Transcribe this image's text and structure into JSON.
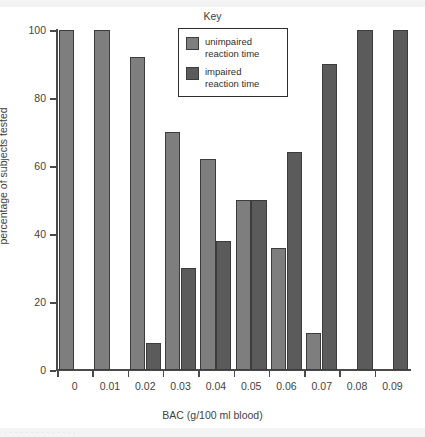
{
  "key_title": "Key",
  "legend": {
    "position": "top-center-inside",
    "entries": [
      {
        "label": "unimpaired\nreaction time",
        "color": "#7e7e7e",
        "series": "unimpaired"
      },
      {
        "label": "impaired\nreaction time",
        "color": "#5b5b5b",
        "series": "impaired"
      }
    ]
  },
  "axes": {
    "y_title": "percentage of subjects tested",
    "x_title": "BAC (g/100 ml blood)",
    "y_ticks": [
      "0",
      "20",
      "40",
      "60",
      "80",
      "100"
    ],
    "x_ticks": [
      "0",
      "0.01",
      "0.02",
      "0.03",
      "0.04",
      "0.05",
      "0.06",
      "0.07",
      "0.08",
      "0.09"
    ]
  },
  "chart_data": {
    "type": "bar",
    "title": "",
    "xlabel": "BAC (g/100 ml blood)",
    "ylabel": "percentage of subjects tested",
    "ylim": [
      0,
      100
    ],
    "ytick_values": [
      0,
      20,
      40,
      60,
      80,
      100
    ],
    "grid": false,
    "legend_position": "top-center",
    "categories": [
      "0",
      "0.01",
      "0.02",
      "0.03",
      "0.04",
      "0.05",
      "0.06",
      "0.07",
      "0.08",
      "0.09"
    ],
    "series": [
      {
        "name": "unimpaired reaction time",
        "color": "#7e7e7e",
        "values": [
          100,
          100,
          92,
          70,
          62,
          50,
          36,
          11,
          0,
          0
        ]
      },
      {
        "name": "impaired reaction time",
        "color": "#5b5b5b",
        "values": [
          0,
          0,
          8,
          30,
          38,
          50,
          64,
          90,
          100,
          100
        ]
      }
    ]
  },
  "footer_cut_text": "· · · · · · · · · · · · · ·"
}
